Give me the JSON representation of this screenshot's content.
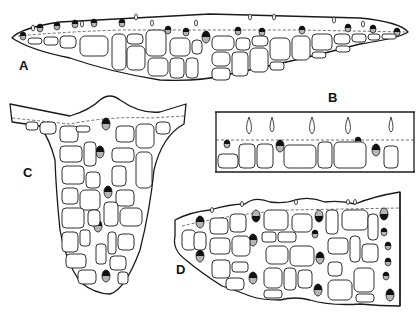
{
  "figure": {
    "panels": [
      {
        "id": "A",
        "label": "A",
        "description": "Elongated leaf cross-section with marginal cells and upper row of pigmented cells"
      },
      {
        "id": "B",
        "label": "B",
        "description": "Enlarged detail of upper epidermis with teardrop papillae and pigmented cells"
      },
      {
        "id": "C",
        "label": "C",
        "description": "T-shaped cross-section with central vertical row of pigmented cells"
      },
      {
        "id": "D",
        "label": "D",
        "description": "Tapering cross-section with scattered pigmented cells"
      }
    ],
    "colors": {
      "line": "#1a1a1a",
      "pigment_dark": "#111111",
      "pigment_light": "#b5b5b5",
      "background": "#ffffff"
    }
  }
}
